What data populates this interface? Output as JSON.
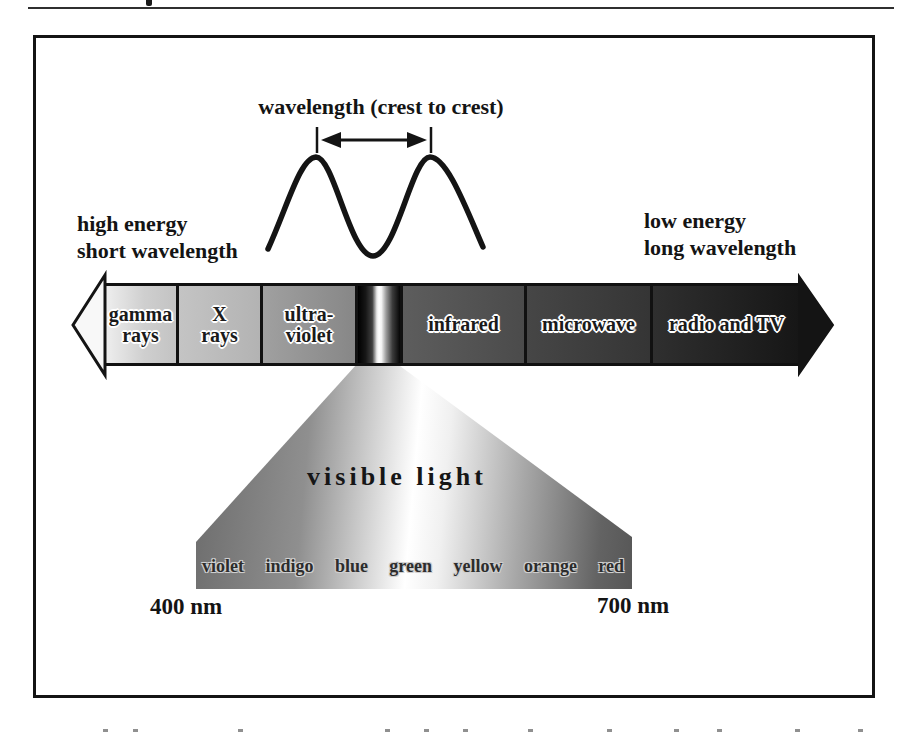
{
  "figure": {
    "wave_label": "wavelength (crest to crest)",
    "left_annotation": {
      "line1": "high energy",
      "line2": "short wavelength"
    },
    "right_annotation": {
      "line1": "low energy",
      "line2": "long wavelength"
    },
    "spectrum": {
      "segments": [
        {
          "id": "gamma-rays",
          "line1": "gamma",
          "line2": "rays"
        },
        {
          "id": "x-rays",
          "line1": "X",
          "line2": "rays"
        },
        {
          "id": "ultraviolet",
          "line1": "ultra-",
          "line2": "violet"
        },
        {
          "id": "visible-band"
        },
        {
          "id": "infrared",
          "line1": "infrared"
        },
        {
          "id": "microwave",
          "line1": "microwave"
        },
        {
          "id": "radio-tv",
          "line1": "radio and TV"
        }
      ]
    },
    "visible_light": {
      "label": "visible light",
      "colors": [
        "violet",
        "indigo",
        "blue",
        "green",
        "yellow",
        "orange",
        "red"
      ],
      "min_wavelength": "400 nm",
      "max_wavelength": "700 nm"
    },
    "palette": {
      "ink": "#141414",
      "high_energy_end_gray": "#efefef",
      "low_energy_end_gray": "#161616"
    }
  }
}
